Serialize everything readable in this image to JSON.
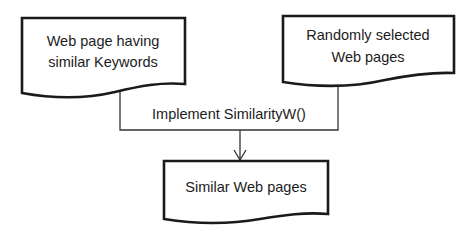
{
  "diagram": {
    "type": "flowchart",
    "nodes": [
      {
        "id": "doc_keywords",
        "shape": "document",
        "lines": [
          "Web page having",
          "similar Keywords"
        ]
      },
      {
        "id": "doc_random",
        "shape": "document",
        "lines": [
          "Randomly selected",
          "Web pages"
        ]
      },
      {
        "id": "process",
        "shape": "process",
        "label": "Implement SimilarityW()"
      },
      {
        "id": "doc_output",
        "shape": "document",
        "lines": [
          "Similar Web pages"
        ]
      }
    ],
    "edges": [
      {
        "from": "doc_keywords",
        "to": "process",
        "style": "line"
      },
      {
        "from": "doc_random",
        "to": "process",
        "style": "line"
      },
      {
        "from": "process",
        "to": "doc_output",
        "style": "arrow"
      }
    ],
    "colors": {
      "stroke": "#1a1a1a",
      "background": "#ffffff"
    }
  }
}
